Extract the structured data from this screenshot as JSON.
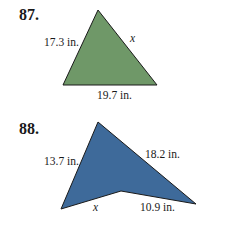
{
  "problems": [
    {
      "number": "87.",
      "shape": "triangle",
      "fill_color": "#6f9868",
      "vertices": [
        [
          98,
          10
        ],
        [
          63,
          85
        ],
        [
          157,
          85
        ]
      ],
      "labels": {
        "left_side": "17.3 in.",
        "right_side": "x",
        "bottom_side": "19.7 in."
      }
    },
    {
      "number": "88.",
      "shape": "concave-quadrilateral",
      "fill_color": "#3e6a9a",
      "vertices": [
        [
          98,
          122
        ],
        [
          196,
          204
        ],
        [
          121,
          191
        ],
        [
          61,
          209
        ]
      ],
      "labels": {
        "left_side": "13.7 in.",
        "upper_right_side": "18.2 in.",
        "lower_left_side": "x",
        "lower_right_side": "10.9 in."
      }
    }
  ]
}
